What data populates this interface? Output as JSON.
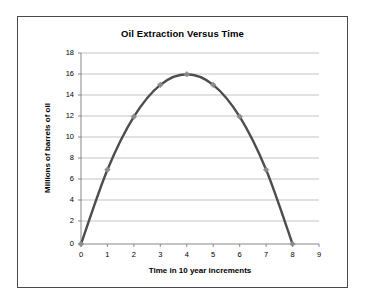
{
  "chart_data": {
    "type": "line",
    "title": "Oil Extraction Versus Time",
    "xlabel": "Time in 10 year increments",
    "ylabel": "Millions of barrels of oil",
    "x": [
      0,
      1,
      2,
      3,
      4,
      5,
      6,
      7,
      8
    ],
    "values": [
      0,
      7,
      12,
      15,
      16,
      15,
      12,
      7,
      0
    ],
    "series": [
      {
        "name": "Oil extraction",
        "values": [
          0,
          7,
          12,
          15,
          16,
          15,
          12,
          7,
          0
        ]
      }
    ],
    "xlim": [
      0,
      9
    ],
    "ylim": [
      0,
      18
    ],
    "xticks": [
      "0",
      "1",
      "2",
      "3",
      "4",
      "5",
      "6",
      "7",
      "8",
      "9"
    ],
    "yticks": [
      "0",
      "2",
      "4",
      "6",
      "8",
      "10",
      "12",
      "14",
      "16",
      "18"
    ],
    "grid": true,
    "legend": "none",
    "marker": "diamond",
    "line_color": "#4d4d4d",
    "marker_color": "#8c8c8c",
    "grid_color": "#9a9a9a"
  },
  "labels": {
    "title": "Oil Extraction Versus Time",
    "x_axis_title": "Time in 10 year increments",
    "y_axis_title": "Millions of barrels of oil"
  }
}
